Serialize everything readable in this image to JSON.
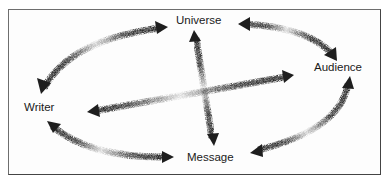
{
  "diagram": {
    "type": "communication-triangle-with-universe",
    "nodes": [
      {
        "id": "universe",
        "label": "Universe",
        "x": 203,
        "y": 21
      },
      {
        "id": "audience",
        "label": "Audience",
        "x": 338,
        "y": 68
      },
      {
        "id": "writer",
        "label": "Writer",
        "x": 39,
        "y": 108
      },
      {
        "id": "message",
        "label": "Message",
        "x": 212,
        "y": 158
      }
    ],
    "edges": [
      {
        "from": "writer",
        "to": "universe",
        "style": "curved-double-arrow"
      },
      {
        "from": "universe",
        "to": "audience",
        "style": "curved-double-arrow"
      },
      {
        "from": "audience",
        "to": "message",
        "style": "curved-double-arrow"
      },
      {
        "from": "message",
        "to": "writer",
        "style": "curved-double-arrow"
      },
      {
        "from": "universe",
        "to": "message",
        "style": "straight-double-arrow"
      },
      {
        "from": "writer",
        "to": "audience",
        "style": "straight-double-arrow"
      }
    ],
    "colors": {
      "arrow": "#1e1e1e",
      "frame": "#555555",
      "text": "#1a1a1a",
      "background": "#ffffff"
    }
  }
}
